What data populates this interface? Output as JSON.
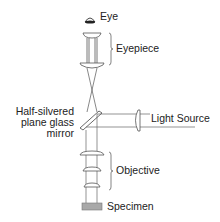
{
  "diagram": {
    "type": "optical-path-diagram",
    "colors": {
      "line": "#555555",
      "specimen_fill": "#a8a8a8",
      "text": "#222222"
    },
    "labels": {
      "eye": "Eye",
      "eyepiece": "Eyepiece",
      "mirror_line1": "Half-silvered",
      "mirror_line2": "plane glass",
      "mirror_line3": "mirror",
      "light_source": "Light Source",
      "objective": "Objective",
      "specimen": "Specimen"
    },
    "components": [
      {
        "id": "eye",
        "icon": "eye-icon"
      },
      {
        "id": "eyepiece",
        "lenses": 2
      },
      {
        "id": "half-silvered-mirror"
      },
      {
        "id": "light-source",
        "lenses": 1
      },
      {
        "id": "objective",
        "lenses": 3
      },
      {
        "id": "specimen"
      }
    ]
  }
}
